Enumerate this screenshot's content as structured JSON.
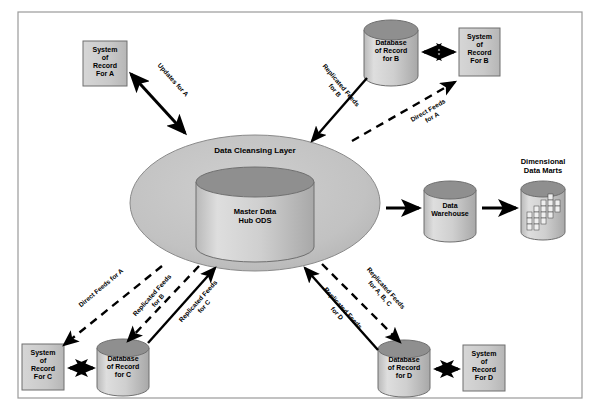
{
  "diagram": {
    "title_visible": false,
    "frame": {
      "border_color": "#9a9a9a",
      "background": "#ffffff"
    },
    "colors": {
      "shape_fill": "#c9c9c9",
      "shape_fill_light": "#d4d4d4",
      "cylinder_top": "#8f8f8f",
      "ellipse_fill": "#c2c2c2",
      "stroke": "#555555",
      "arrow": "#000000",
      "text": "#000000"
    },
    "nodes": [
      {
        "id": "sor-a",
        "type": "box",
        "label": "System\nof\nRecord\nFor A",
        "lines": [
          "System",
          "of",
          "Record",
          "For A"
        ]
      },
      {
        "id": "db-b",
        "type": "cylinder",
        "label": "Database\nof Record\nfor B",
        "lines": [
          "Database",
          "of Record",
          "for B"
        ]
      },
      {
        "id": "sor-b",
        "type": "box",
        "label": "System\nof\nRecord\nFor B",
        "lines": [
          "System",
          "of",
          "Record",
          "For B"
        ]
      },
      {
        "id": "cleansing-layer",
        "type": "ellipse",
        "label": "Data Cleansing Layer",
        "lines": [
          "Data Cleansing Layer"
        ]
      },
      {
        "id": "hub-ods",
        "type": "cylinder",
        "label": "Master Data\nHub ODS",
        "lines": [
          "Master Data",
          "Hub ODS"
        ]
      },
      {
        "id": "data-warehouse",
        "type": "cylinder",
        "label": "Data\nWarehouse",
        "lines": [
          "Data",
          "Warehouse"
        ]
      },
      {
        "id": "data-marts",
        "type": "cylinder-cubes",
        "label": "Dimensional\nData Marts",
        "lines": [
          "Dimensional",
          "Data Marts"
        ]
      },
      {
        "id": "sor-c",
        "type": "box",
        "label": "System\nof\nRecord\nFor C",
        "lines": [
          "System",
          "of",
          "Record",
          "For C"
        ]
      },
      {
        "id": "db-c",
        "type": "cylinder",
        "label": "Database\nof Record\nfor C",
        "lines": [
          "Database",
          "of Record",
          "for C"
        ]
      },
      {
        "id": "db-d",
        "type": "cylinder",
        "label": "Database\nof Record\nfor D",
        "lines": [
          "Database",
          "of Record",
          "for D"
        ]
      },
      {
        "id": "sor-d",
        "type": "box",
        "label": "System\nof\nRecord\nFor D",
        "lines": [
          "System",
          "of",
          "Record",
          "For D"
        ]
      }
    ],
    "edges": [
      {
        "id": "updates-for-a",
        "label": "Updates for A",
        "style": "solid",
        "arrow": "double",
        "from": "cleansing-layer",
        "to": "sor-a"
      },
      {
        "id": "replicated-feeds-for-b",
        "label": "Replicated Feeds\nfor B",
        "lines": [
          "Replicated Feeds",
          "for B"
        ],
        "style": "solid",
        "arrow": "single",
        "from": "db-b",
        "to": "cleansing-layer"
      },
      {
        "id": "direct-feeds-for-a",
        "label": "Direct Feeds\nfor A",
        "lines": [
          "Direct Feeds",
          "for A"
        ],
        "style": "dashed",
        "arrow": "single",
        "from": "cleansing-layer",
        "to": "sor-b"
      },
      {
        "id": "db-b-to-sor-b",
        "label": "",
        "style": "solid",
        "arrow": "double",
        "from": "db-b",
        "to": "sor-b"
      },
      {
        "id": "hub-to-warehouse",
        "label": "",
        "style": "solid",
        "arrow": "single",
        "from": "cleansing-layer",
        "to": "data-warehouse"
      },
      {
        "id": "warehouse-to-marts",
        "label": "",
        "style": "solid",
        "arrow": "single",
        "from": "data-warehouse",
        "to": "data-marts"
      },
      {
        "id": "direct-feeds-for-a-c",
        "label": "Direct Feeds for A",
        "lines": [
          "Direct Feeds for A"
        ],
        "style": "dashed",
        "arrow": "single",
        "from": "cleansing-layer",
        "to": "sor-c"
      },
      {
        "id": "replicated-feeds-for-b-lower",
        "label": "Replicated Feeds\nfor B",
        "lines": [
          "Replicated Feeds",
          "for B"
        ],
        "style": "dashed",
        "arrow": "single",
        "from": "cleansing-layer",
        "to": "db-c"
      },
      {
        "id": "replicated-feeds-for-c",
        "label": "Replicated Feeds\nfor C",
        "lines": [
          "Replicated Feeds",
          "for C"
        ],
        "style": "solid",
        "arrow": "single",
        "from": "db-c",
        "to": "cleansing-layer"
      },
      {
        "id": "replicated-feeds-for-abc",
        "label": "Replicated Feeds\nfor A, B, C",
        "lines": [
          "Replicated Feeds",
          "for A, B, C"
        ],
        "style": "dashed",
        "arrow": "single",
        "from": "cleansing-layer",
        "to": "db-d"
      },
      {
        "id": "replicated-feeds-for-d",
        "label": "Replicated Feeds\nfor D",
        "lines": [
          "Replicated Feeds",
          "for D"
        ],
        "style": "solid",
        "arrow": "single",
        "from": "db-d",
        "to": "cleansing-layer"
      },
      {
        "id": "sor-c-to-db-c",
        "label": "",
        "style": "solid",
        "arrow": "double",
        "from": "sor-c",
        "to": "db-c"
      },
      {
        "id": "db-d-to-sor-d",
        "label": "",
        "style": "solid",
        "arrow": "double",
        "from": "db-d",
        "to": "sor-d"
      }
    ]
  }
}
